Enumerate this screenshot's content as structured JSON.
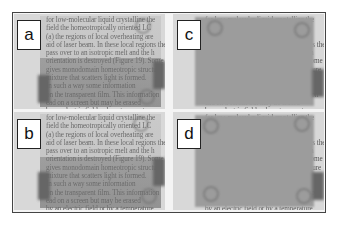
{
  "figure": {
    "panels": [
      {
        "id": "a",
        "label": "a",
        "state": "text visible through film"
      },
      {
        "id": "b",
        "label": "b",
        "state": "text visible through film"
      },
      {
        "id": "c",
        "label": "c",
        "state": "film opaque / scattering, text hidden"
      },
      {
        "id": "d",
        "label": "d",
        "state": "film opaque / scattering, text hidden"
      }
    ],
    "background_text_lines": [
      "for low-molecular liquid crystalline the",
      "field the homeotropically oriented LC",
      "(a) the regions of local overheating are",
      "aid of laser beam. In these local regions the",
      "pass over to an isotropic melt and the h",
      "orientation is destroyed (Figure 19). Some",
      "gives monodomain homeotropic structure",
      "mixture that scatters light is formed.",
      "In such a way some information",
      "on the transparent film. This information",
      "ead on a screen but may be erased",
      "by an electric field or by a temperature"
    ],
    "colors": {
      "frame": "#444444",
      "paper": "#d8d8d8",
      "text": "#555555",
      "opaque_film": "#9c9c9c",
      "label_bg": "#ffffff",
      "label_border": "#222222"
    }
  }
}
